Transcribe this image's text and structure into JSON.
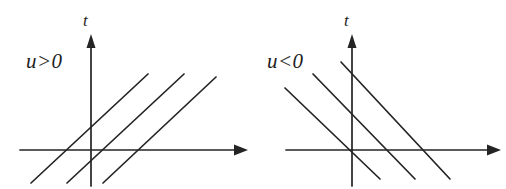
{
  "figure": {
    "type": "diagram",
    "background_color": "#ffffff",
    "line_color": "#242424",
    "width": 506,
    "height": 189
  },
  "panels": [
    {
      "id": "left",
      "condition_label": "u>0",
      "vertical_axis_label": "t",
      "horizontal_axis_label": "",
      "slope_sign": "positive",
      "characteristic_count": 3,
      "axes": {
        "vertical": {
          "x": 91,
          "y_top": 35,
          "y_bottom": 186
        },
        "horizontal": {
          "y": 150,
          "x_left": 20,
          "x_right": 247
        }
      },
      "characteristics": [
        {
          "x1": 31,
          "y1": 183,
          "x2": 148,
          "y2": 74
        },
        {
          "x1": 67,
          "y1": 183,
          "x2": 184,
          "y2": 74
        },
        {
          "x1": 103,
          "y1": 183,
          "x2": 216,
          "y2": 77
        }
      ],
      "label_position": {
        "x": 26,
        "y": 68
      }
    },
    {
      "id": "right",
      "condition_label": "u<0",
      "vertical_axis_label": "t",
      "horizontal_axis_label": "",
      "slope_sign": "negative",
      "characteristic_count": 3,
      "axes": {
        "vertical": {
          "x": 99,
          "y_top": 35,
          "y_bottom": 186
        },
        "horizontal": {
          "y": 150,
          "x_left": 33,
          "x_right": 247
        }
      },
      "characteristics": [
        {
          "x1": 32,
          "y1": 88,
          "x2": 127,
          "y2": 179
        },
        {
          "x1": 60,
          "y1": 74,
          "x2": 162,
          "y2": 179
        },
        {
          "x1": 88,
          "y1": 62,
          "x2": 197,
          "y2": 179
        }
      ],
      "label_position": {
        "x": 14,
        "y": 68
      }
    }
  ]
}
